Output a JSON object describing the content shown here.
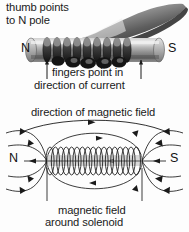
{
  "figure": {
    "background_color": "#fdfdfd",
    "ink_color": "#1a1a1a",
    "metal_color": "#9a9a9a",
    "hand_color": "#6e6e6e"
  },
  "top_diagram": {
    "caption_thumb_line1": "thumb points",
    "caption_thumb_line2": "to N pole",
    "caption_fingers_line1": "fingers point in",
    "caption_fingers_line2": "direction of current",
    "pole_left": "N",
    "pole_right": "S",
    "icons": {
      "hand": "hand-grip-icon",
      "solenoid": "solenoid-cylinder-icon",
      "current_arrow_left": "up-arrow-icon",
      "current_arrow_right": "up-arrow-icon"
    }
  },
  "bottom_diagram": {
    "caption_top": "direction of magnetic field",
    "caption_bottom_line1": "magnetic field",
    "caption_bottom_line2": "around solenoid",
    "pole_left": "N",
    "pole_right": "S",
    "coil_turns": 17,
    "icons": {
      "coil": "solenoid-coil-icon",
      "field_lines": "magnetic-field-line-icon",
      "field_direction_arrow": "arrowhead-icon",
      "leader_line_left": "leader-line-icon",
      "leader_line_right": "leader-line-icon"
    }
  }
}
